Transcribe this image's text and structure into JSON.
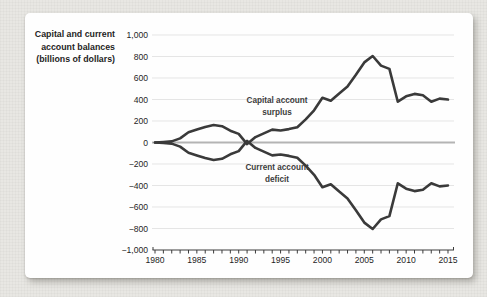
{
  "page_background": "#e8e7e3",
  "panel_background": "#fefefe",
  "chart_data": {
    "type": "line",
    "title": "Capital and current account balances (billions of dollars)",
    "title_lines": [
      "Capital and current",
      "account balances",
      "(billions of dollars)"
    ],
    "x": [
      1980,
      1981,
      1982,
      1983,
      1984,
      1985,
      1986,
      1987,
      1988,
      1989,
      1990,
      1991,
      1992,
      1993,
      1994,
      1995,
      1996,
      1997,
      1998,
      1999,
      2000,
      2001,
      2002,
      2003,
      2004,
      2005,
      2006,
      2007,
      2008,
      2009,
      2010,
      2011,
      2012,
      2013,
      2014,
      2015
    ],
    "series": [
      {
        "name": "Capital account surplus",
        "annotation_lines": [
          "Capital account",
          "surplus"
        ],
        "color": "#3a3a3a",
        "values": [
          0,
          5,
          10,
          38,
          95,
          120,
          145,
          163,
          152,
          110,
          80,
          -15,
          50,
          85,
          120,
          112,
          125,
          142,
          215,
          300,
          416,
          388,
          457,
          520,
          630,
          745,
          805,
          715,
          685,
          380,
          430,
          452,
          440,
          380,
          408,
          400
        ]
      },
      {
        "name": "Current account deficit",
        "annotation_lines": [
          "Current account",
          "deficit"
        ],
        "color": "#3a3a3a",
        "values": [
          0,
          -5,
          -10,
          -38,
          -95,
          -120,
          -145,
          -163,
          -152,
          -110,
          -80,
          15,
          -50,
          -85,
          -120,
          -112,
          -125,
          -142,
          -215,
          -300,
          -416,
          -388,
          -457,
          -520,
          -630,
          -745,
          -805,
          -715,
          -685,
          -380,
          -430,
          -452,
          -440,
          -380,
          -408,
          -400
        ]
      }
    ],
    "xlabel": "",
    "ylabel": "",
    "xlim": [
      1980,
      2015
    ],
    "ylim": [
      -1000,
      1000
    ],
    "ytick_step": 200,
    "ytick_labels": [
      "1,000",
      "800",
      "600",
      "400",
      "200",
      "0",
      "−200",
      "−400",
      "−600",
      "−800",
      "−1,000"
    ],
    "xtick_labels": [
      "1980",
      "1985",
      "1990",
      "1995",
      "2000",
      "2005",
      "2010",
      "2015"
    ],
    "xtick_label_step": 5,
    "grid": true,
    "legend_position": "inline-annotations",
    "colors": {
      "line": "#3a3a3a",
      "grid": "#e5e5e5",
      "zero_line": "#b4b4b4",
      "axis": "#3c3c3c",
      "tick_text": "#1e1e1e",
      "annotation_text": "#3c3c3c"
    }
  }
}
